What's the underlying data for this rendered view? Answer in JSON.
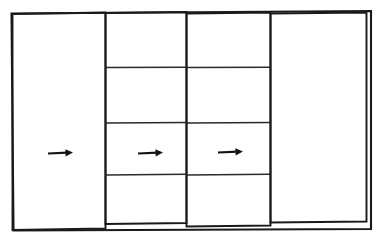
{
  "figure": {
    "title": "",
    "kind": "line-drawing",
    "background_color": "#ffffff",
    "ink_color": "#1a1a1a",
    "canvas": {
      "width": 377,
      "height": 240
    }
  },
  "panels": [
    {
      "id": "panel-1",
      "name": "left-panel",
      "label": "",
      "x": 12.5,
      "y": 14.0,
      "width": 93.0,
      "height": 216.0,
      "skew": -1.5,
      "rows": []
    },
    {
      "id": "panel-2",
      "name": "second-panel",
      "label": "",
      "x": 105.5,
      "y": 13.0,
      "width": 81.0,
      "height": 211.0,
      "skew": -1.0,
      "rows": [
        67.5,
        123.0,
        175.0
      ]
    },
    {
      "id": "panel-3",
      "name": "third-panel",
      "label": "",
      "x": 186.5,
      "y": 13.5,
      "width": 84.0,
      "height": 213.0,
      "skew": -1.0,
      "rows": [
        67.5,
        123.0,
        175.0
      ]
    },
    {
      "id": "panel-4",
      "name": "right-panel",
      "label": "",
      "x": 270.5,
      "y": 13.5,
      "width": 96.0,
      "height": 209.0,
      "skew": -1.0,
      "rows": []
    }
  ],
  "outer_frame": {
    "name": "outer-frame",
    "x": 11.5,
    "y": 12.0,
    "width": 358.0,
    "height": 218.0
  },
  "arrows": [
    {
      "id": "arrow-1",
      "name": "flow-arrow-left",
      "x1": 48,
      "y1": 153.5,
      "x2": 73,
      "y2": 152.5,
      "direction": "right",
      "glyph": "→"
    },
    {
      "id": "arrow-2",
      "name": "flow-arrow-middle",
      "x1": 138,
      "y1": 153.5,
      "x2": 163,
      "y2": 152.5,
      "direction": "right",
      "glyph": "→"
    },
    {
      "id": "arrow-3",
      "name": "flow-arrow-right",
      "x1": 218,
      "y1": 152.5,
      "x2": 243,
      "y2": 151.5,
      "direction": "right",
      "glyph": "→"
    }
  ],
  "dividers": {
    "count": 3,
    "y_positions": [
      67.5,
      123.0,
      175.0
    ]
  }
}
